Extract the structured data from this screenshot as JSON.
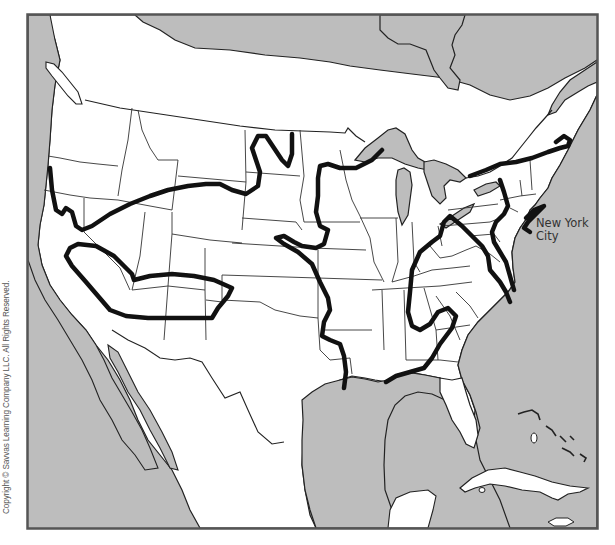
{
  "map": {
    "type": "outline map of the contiguous United States with southern Canada, northern Mexico and the Caribbean",
    "colors": {
      "water": "#bdbdbd",
      "land": "#ffffff",
      "state_border": "#333333",
      "contour_line": "#111111",
      "frame": "#555555"
    },
    "labels": {
      "city_line1": "New York",
      "city_line2": "City"
    },
    "copyright": "Copyright © Savvas Learning Company LLC. All Rights Reserved.",
    "contour_lines_count": 4
  }
}
